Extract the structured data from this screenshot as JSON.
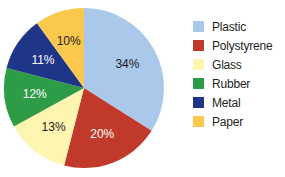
{
  "chart_data": {
    "type": "pie",
    "title": "",
    "categories": [
      "Plastic",
      "Polystyrene",
      "Glass",
      "Rubber",
      "Metal",
      "Paper"
    ],
    "values": [
      34,
      20,
      13,
      12,
      11,
      10
    ],
    "labels": [
      "34%",
      "20%",
      "13%",
      "12%",
      "11%",
      "10%"
    ],
    "colors": [
      "#a9c8ea",
      "#c0392b",
      "#fdf5b0",
      "#2e9b47",
      "#1f3588",
      "#fbc84e"
    ],
    "label_colors": [
      "#1a1a1a",
      "#ffffff",
      "#1a1a1a",
      "#ffffff",
      "#ffffff",
      "#1a1a1a"
    ],
    "legend_position": "right"
  },
  "legend": {
    "items": [
      {
        "label": "Plastic",
        "color": "#a9c8ea"
      },
      {
        "label": "Polystyrene",
        "color": "#c0392b"
      },
      {
        "label": "Glass",
        "color": "#fdf5b0"
      },
      {
        "label": "Rubber",
        "color": "#2e9b47"
      },
      {
        "label": "Metal",
        "color": "#1f3588"
      },
      {
        "label": "Paper",
        "color": "#fbc84e"
      }
    ]
  }
}
